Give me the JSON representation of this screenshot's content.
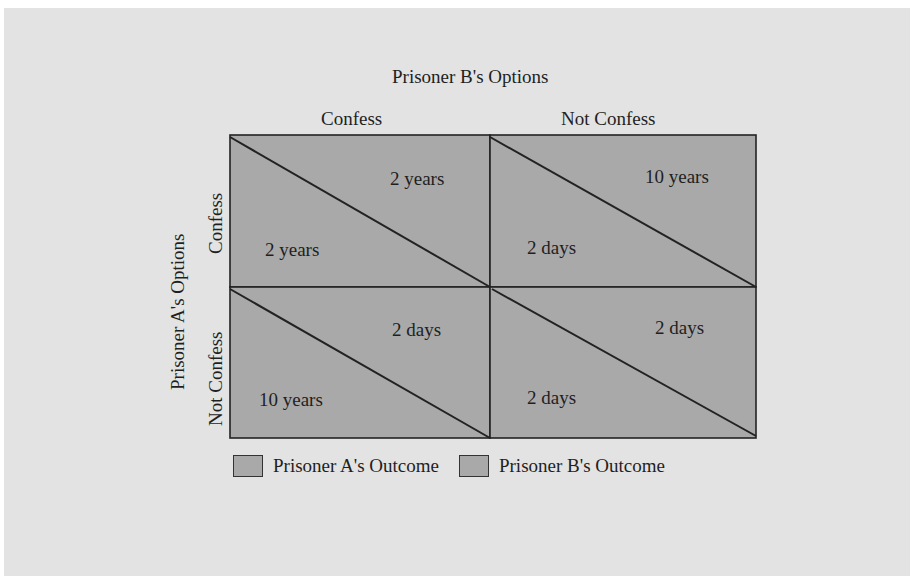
{
  "figure": {
    "cutoff_caption": "...Figure ... Prisoner's Dilemma ...",
    "col_title": "Prisoner B's Options",
    "row_title": "Prisoner A's Options",
    "columns": [
      {
        "label": "Confess"
      },
      {
        "label": "Not Confess"
      }
    ],
    "rows": [
      {
        "label": "Confess"
      },
      {
        "label": "Not Confess"
      }
    ],
    "cells": [
      [
        {
          "a_outcome": "2 years",
          "b_outcome": "2 years"
        },
        {
          "a_outcome": "2 days",
          "b_outcome": "10 years"
        }
      ],
      [
        {
          "a_outcome": "10 years",
          "b_outcome": "2 days"
        },
        {
          "a_outcome": "2 days",
          "b_outcome": "2 days"
        }
      ]
    ],
    "legend": [
      {
        "label": "Prisoner A's Outcome",
        "color": "#a9a9a9"
      },
      {
        "label": "Prisoner B's Outcome",
        "color": "#a9a9a9"
      }
    ],
    "colors": {
      "panel_bg": "#e3e3e3",
      "cell_fill": "#a9a9a9",
      "line": "#222222"
    }
  }
}
